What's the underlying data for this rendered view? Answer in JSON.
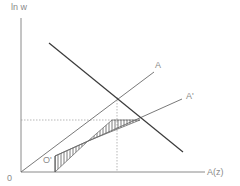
{
  "diagram": {
    "y_axis_label": "ln w",
    "x_axis_label": "A(z)",
    "origin_label": "0",
    "shifted_origin_label": "O'",
    "line_labels": {
      "line_a": "A",
      "line_a_prime": "A'"
    },
    "colors": {
      "axis": "#8a8a8a",
      "line": "#3a3a3a",
      "guide": "#9a9a9a",
      "hatch": "#5a5a5a",
      "label": "#8a8a8a"
    }
  }
}
